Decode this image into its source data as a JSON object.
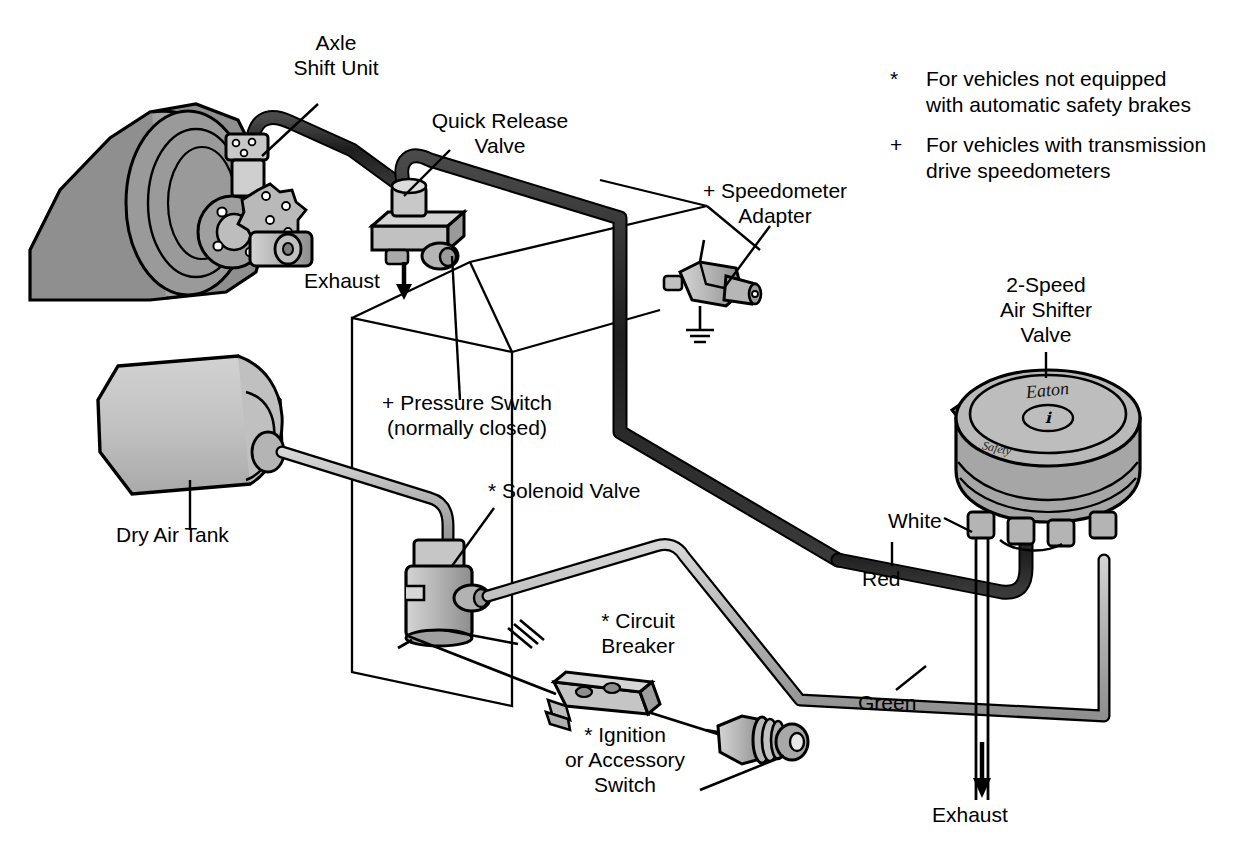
{
  "colors": {
    "ink": "#000000",
    "metal_light": "#c4c4c4",
    "metal_mid": "#a8a8a8",
    "metal_dark": "#8a8a8a",
    "hose_dark": "#2a2a2a",
    "line_gray": "#b5b5b5",
    "background": "#ffffff"
  },
  "labels": {
    "axle_shift_unit": "Axle\nShift Unit",
    "quick_release_valve": "Quick Release\nValve",
    "speedometer_adapter": "+ Speedometer\nAdapter",
    "exhaust_top": "Exhaust",
    "pressure_switch": "+ Pressure Switch\n(normally closed)",
    "dry_air_tank": "Dry Air Tank",
    "solenoid_valve": "* Solenoid Valve",
    "circuit_breaker": "* Circuit\nBreaker",
    "ignition_switch": "* Ignition\nor Accessory\nSwitch",
    "air_shifter_valve": "2-Speed\nAir Shifter\nValve",
    "wire_white": "White",
    "wire_red": "Red",
    "wire_green": "Green",
    "exhaust_bottom": "Exhaust"
  },
  "valve_marking": {
    "brand": "Eaton",
    "sub": "Safety"
  },
  "legend": [
    {
      "symbol": "*",
      "text": "For vehicles not equipped\nwith automatic safety brakes"
    },
    {
      "symbol": "+",
      "text": "For vehicles with transmission\ndrive speedometers"
    }
  ],
  "icons": {
    "exhaust_arrow": "down-arrow-icon",
    "ground": "ground-symbol-icon"
  }
}
